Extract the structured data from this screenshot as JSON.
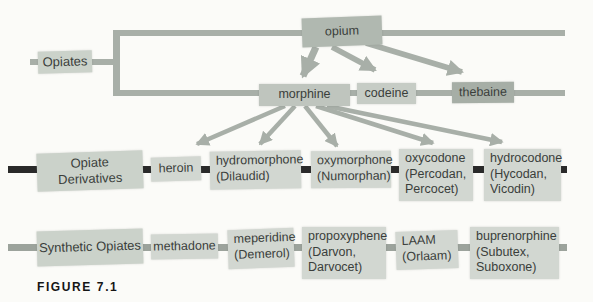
{
  "caption": "FIGURE 7.1",
  "colors": {
    "bg": "#fbfbf8",
    "text": "#3a3e3b",
    "line_gray": "#a8afa8",
    "line_dark": "#2a2a2a",
    "line_row3": "#9ca39c",
    "box_item": "#d2d7d1",
    "box_category": "#cbd2ca",
    "box_opium": "#b0b8b0",
    "box_morphine": "#bfc5be",
    "box_codeine": "#c6ccc5",
    "box_thebaine": "#a6aea6",
    "caption": "#151515"
  },
  "natural": {
    "label": "Opiates",
    "nodes": {
      "opium": "opium",
      "morphine": "morphine",
      "codeine": "codeine",
      "thebaine": "thebaine"
    }
  },
  "derivatives": {
    "label": "Opiate Derivatives",
    "items": [
      {
        "name": "heroin",
        "brand": ""
      },
      {
        "name": "hydromorphone",
        "brand": "(Dilaudid)"
      },
      {
        "name": "oxymorphone",
        "brand": "(Numorphan)"
      },
      {
        "name": "oxycodone",
        "brand": "(Percodan,\nPercocet)"
      },
      {
        "name": "hydrocodone",
        "brand": "(Hycodan,\nVicodin)"
      }
    ]
  },
  "synthetic": {
    "label": "Synthetic Opiates",
    "items": [
      {
        "name": "methadone",
        "brand": ""
      },
      {
        "name": "meperidine",
        "brand": "(Demerol)"
      },
      {
        "name": "propoxyphene",
        "brand": "(Darvon,\nDarvocet)"
      },
      {
        "name": "LAAM",
        "brand": "(Orlaam)"
      },
      {
        "name": "buprenorphine",
        "brand": "(Subutex,\nSuboxone)"
      }
    ]
  },
  "edges": [
    {
      "from": "opium",
      "to": "morphine"
    },
    {
      "from": "opium",
      "to": "codeine"
    },
    {
      "from": "opium",
      "to": "thebaine"
    },
    {
      "from": "morphine",
      "to": "heroin"
    },
    {
      "from": "morphine",
      "to": "hydromorphone"
    },
    {
      "from": "morphine",
      "to": "oxymorphone"
    },
    {
      "from": "morphine",
      "to": "oxycodone"
    },
    {
      "from": "morphine",
      "to": "hydrocodone"
    }
  ]
}
